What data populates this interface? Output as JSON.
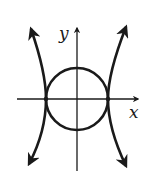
{
  "figure": {
    "axes": {
      "x_label": "x",
      "y_label": "y"
    },
    "curves": [
      {
        "name": "circle",
        "center": [
          0,
          0
        ],
        "radius": 1
      },
      {
        "name": "hyperbola",
        "orientation": "horizontal",
        "vertices": [
          [
            -1,
            0
          ],
          [
            1,
            0
          ]
        ]
      }
    ],
    "colors": {
      "stroke": "#1a1a1a",
      "background": "#ffffff"
    }
  }
}
